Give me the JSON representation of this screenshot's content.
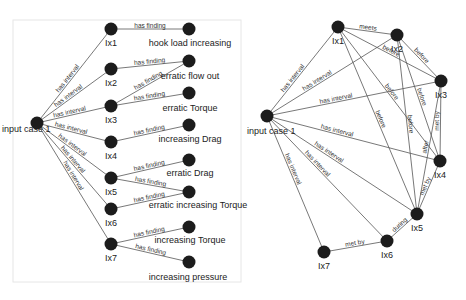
{
  "diagrams": [
    {
      "id": "left",
      "nodes": [
        {
          "id": "case",
          "label": "input case 1"
        },
        {
          "id": "Ix1",
          "label": "Ix1"
        },
        {
          "id": "Ix2",
          "label": "Ix2"
        },
        {
          "id": "Ix3",
          "label": "Ix3"
        },
        {
          "id": "Ix4",
          "label": "Ix4"
        },
        {
          "id": "Ix5",
          "label": "Ix5"
        },
        {
          "id": "Ix6",
          "label": "Ix6"
        },
        {
          "id": "Ix7",
          "label": "Ix7"
        },
        {
          "id": "f1",
          "label": "hook load increasing"
        },
        {
          "id": "f2",
          "label": "erratic flow out"
        },
        {
          "id": "f3",
          "label": "erratic Torque"
        },
        {
          "id": "f4",
          "label": "increasing Drag"
        },
        {
          "id": "f5",
          "label": "erratic Drag"
        },
        {
          "id": "f6",
          "label": "erratic increasing  Torque"
        },
        {
          "id": "f7",
          "label": "increasing Torque"
        },
        {
          "id": "f8",
          "label": "increasing pressure"
        }
      ],
      "edges": [
        {
          "from": "case",
          "to": "Ix1",
          "label": "has interval"
        },
        {
          "from": "case",
          "to": "Ix2",
          "label": "has interval"
        },
        {
          "from": "case",
          "to": "Ix3",
          "label": "has interval"
        },
        {
          "from": "case",
          "to": "Ix4",
          "label": "has interval"
        },
        {
          "from": "case",
          "to": "Ix5",
          "label": "has interval"
        },
        {
          "from": "case",
          "to": "Ix6",
          "label": "has interval"
        },
        {
          "from": "case",
          "to": "Ix7",
          "label": "has interval"
        },
        {
          "from": "Ix1",
          "to": "f1",
          "label": "has finding"
        },
        {
          "from": "Ix2",
          "to": "f2",
          "label": "has finding"
        },
        {
          "from": "Ix3",
          "to": "f2",
          "label": "has finding"
        },
        {
          "from": "Ix3",
          "to": "f3",
          "label": "has finding"
        },
        {
          "from": "Ix4",
          "to": "f4",
          "label": "has finding"
        },
        {
          "from": "Ix5",
          "to": "f5",
          "label": "has finding"
        },
        {
          "from": "Ix5",
          "to": "f6",
          "label": "has finding"
        },
        {
          "from": "Ix6",
          "to": "f6",
          "label": "has finding"
        },
        {
          "from": "Ix7",
          "to": "f7",
          "label": "has finding"
        },
        {
          "from": "Ix7",
          "to": "f8",
          "label": "has finding"
        }
      ]
    },
    {
      "id": "right",
      "nodes": [
        {
          "id": "case",
          "label": "input case 1"
        },
        {
          "id": "Ix1",
          "label": "Ix1"
        },
        {
          "id": "Ix2",
          "label": "Ix2"
        },
        {
          "id": "Ix3",
          "label": "Ix3"
        },
        {
          "id": "Ix4",
          "label": "Ix4"
        },
        {
          "id": "Ix5",
          "label": "Ix5"
        },
        {
          "id": "Ix6",
          "label": "Ix6"
        },
        {
          "id": "Ix7",
          "label": "Ix7"
        }
      ],
      "edges": [
        {
          "from": "case",
          "to": "Ix1",
          "label": "has interval"
        },
        {
          "from": "case",
          "to": "Ix2",
          "label": "has interval"
        },
        {
          "from": "case",
          "to": "Ix3",
          "label": "has interval"
        },
        {
          "from": "case",
          "to": "Ix4",
          "label": "has interval"
        },
        {
          "from": "case",
          "to": "Ix5",
          "label": "has interval"
        },
        {
          "from": "case",
          "to": "Ix6",
          "label": "has interval"
        },
        {
          "from": "case",
          "to": "Ix7",
          "label": "has interval"
        },
        {
          "from": "Ix1",
          "to": "Ix2",
          "label": "meets"
        },
        {
          "from": "Ix1",
          "to": "Ix3",
          "label": "before"
        },
        {
          "from": "Ix1",
          "to": "Ix4",
          "label": "before"
        },
        {
          "from": "Ix1",
          "to": "Ix5",
          "label": "before"
        },
        {
          "from": "Ix2",
          "to": "Ix3",
          "label": "before"
        },
        {
          "from": "Ix2",
          "to": "Ix4",
          "label": "before"
        },
        {
          "from": "Ix2",
          "to": "Ix5",
          "label": "before"
        },
        {
          "from": "Ix3",
          "to": "Ix4",
          "label": "met by"
        },
        {
          "from": "Ix3",
          "to": "Ix5",
          "label": "after"
        },
        {
          "from": "Ix4",
          "to": "Ix5",
          "label": "met by"
        },
        {
          "from": "Ix5",
          "to": "Ix6",
          "label": "during"
        },
        {
          "from": "Ix6",
          "to": "Ix7",
          "label": "met by"
        }
      ]
    }
  ]
}
